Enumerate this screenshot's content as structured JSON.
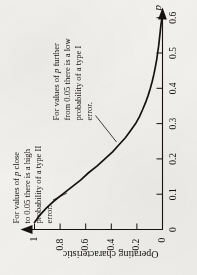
{
  "figure": {
    "background_color": "#f3f1ee",
    "ink_color": "#15120f",
    "rotation_degrees": -90
  },
  "chart_data": {
    "type": "line",
    "title": "",
    "xlabel": "p",
    "ylabel": "Operating characteristic",
    "xlim": [
      0,
      0.65
    ],
    "ylim": [
      0,
      1.05
    ],
    "xticks": [
      "0",
      "0.1",
      "0.2",
      "0.3",
      "0.4",
      "0.5",
      "0.6"
    ],
    "xtick_values": [
      0,
      0.1,
      0.2,
      0.3,
      0.4,
      0.5,
      0.6
    ],
    "yticks": [
      "0",
      "0.2",
      "0.4",
      "0.6",
      "0.8",
      "1"
    ],
    "ytick_values": [
      0,
      0.2,
      0.4,
      0.6,
      0.8,
      1
    ],
    "grid": false,
    "legend": null,
    "series": [
      {
        "name": "Operating characteristic",
        "x": [
          0.02,
          0.04,
          0.06,
          0.08,
          0.1,
          0.12,
          0.14,
          0.16,
          0.18,
          0.2,
          0.22,
          0.24,
          0.26,
          0.28,
          0.3,
          0.32,
          0.34,
          0.36,
          0.38,
          0.4,
          0.42,
          0.44,
          0.46,
          0.48,
          0.5,
          0.52,
          0.54,
          0.56,
          0.58,
          0.6
        ],
        "y": [
          1.0,
          0.96,
          0.91,
          0.85,
          0.78,
          0.71,
          0.64,
          0.58,
          0.51,
          0.45,
          0.39,
          0.34,
          0.29,
          0.25,
          0.21,
          0.18,
          0.155,
          0.132,
          0.112,
          0.095,
          0.08,
          0.067,
          0.056,
          0.046,
          0.038,
          0.03,
          0.024,
          0.018,
          0.012,
          0.004
        ]
      }
    ],
    "annotations": [
      {
        "id": "type-two-error-note",
        "lines": [
          "For values of p close",
          "to 0.05 there is a high",
          "probability of a type II",
          "error."
        ],
        "emphasis": "p",
        "points_to": {
          "x": 0.085,
          "y": 0.815
        }
      },
      {
        "id": "type-one-error-note",
        "lines": [
          "For values of p further",
          "from 0.05 there is a low",
          "probability of a type I",
          "error."
        ],
        "emphasis": "p",
        "points_to": {
          "x": 0.275,
          "y": 0.238
        }
      }
    ],
    "axis_arrows": {
      "x_axis_arrow": true,
      "y_axis_arrow": true
    }
  }
}
